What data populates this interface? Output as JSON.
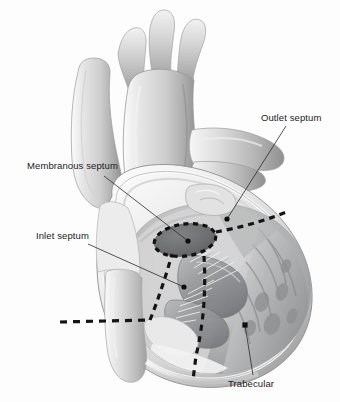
{
  "figure": {
    "background_color": "#fdfdfd",
    "ink_color": "#1b1b1b",
    "width": 340,
    "height": 402
  },
  "labels": [
    {
      "id": "outlet-septum",
      "text": "Outlet septum",
      "x": 261,
      "y": 112,
      "leader": {
        "from_x": 286,
        "from_y": 126,
        "to_x": 227,
        "to_y": 219
      },
      "dot": {
        "x": 227,
        "y": 219
      }
    },
    {
      "id": "membranous-septum",
      "text": "Membranous septum",
      "x": 27,
      "y": 160,
      "leader": {
        "from_x": 104,
        "from_y": 176,
        "to_x": 188,
        "to_y": 241
      },
      "dot": {
        "x": 188,
        "y": 241
      }
    },
    {
      "id": "inlet-septum",
      "text": "Inlet septum",
      "x": 36,
      "y": 230,
      "leader": {
        "from_x": 88,
        "from_y": 244,
        "to_x": 184,
        "to_y": 287
      },
      "dot": {
        "x": 184,
        "y": 287
      }
    },
    {
      "id": "trabecular",
      "text": "Trabecular",
      "x": 228,
      "y": 378,
      "leader": {
        "from_x": 253,
        "from_y": 375,
        "to_x": 245,
        "to_y": 325
      },
      "dot": {
        "x": 245,
        "y": 325
      }
    }
  ],
  "regions": [
    {
      "id": "membranous-septum-patch",
      "name": "membranous septum dark oval",
      "shape": "ellipse",
      "cx": 185,
      "cy": 240,
      "rx": 31,
      "ry": 16,
      "rotation": -8,
      "fill": "#6e6f70",
      "outline": "dashed"
    }
  ],
  "dashed_boundaries": [
    {
      "id": "outlet-boundary",
      "description": "dashed line ascending to upper right from membranous oval"
    },
    {
      "id": "inlet-boundary",
      "description": "horizontal dashed line at left toward inferior septum"
    },
    {
      "id": "trabecular-boundary",
      "description": "dashed line descending vertically toward apex"
    }
  ],
  "colors": {
    "background": "#fdfdfd",
    "label_text": "#1b1b1b",
    "leader_line": "#2a2a2a",
    "dash_line": "#141414",
    "oval_fill": "#6e6f70",
    "tissue_light": "#efefef",
    "tissue_mid": "#c9c9c9",
    "tissue_dark": "#8f9091",
    "chamber_shadow": "#9a9a9b"
  }
}
